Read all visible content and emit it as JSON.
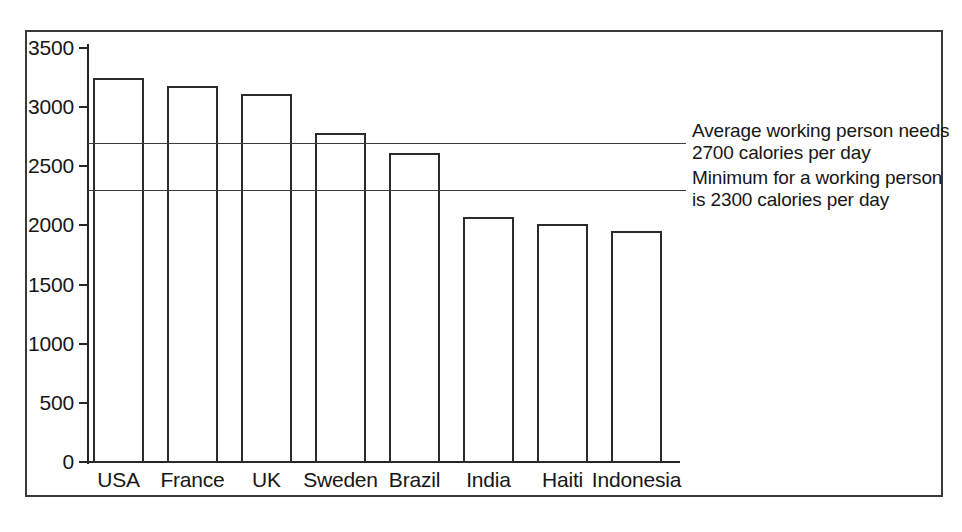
{
  "chart_data": {
    "type": "bar",
    "title": "",
    "subtitle": "",
    "xlabel": "",
    "ylabel": "",
    "categories": [
      "USA",
      "France",
      "UK",
      "Sweden",
      "Brazil",
      "India",
      "Haiti",
      "Indonesia"
    ],
    "values": [
      3250,
      3175,
      3110,
      2780,
      2610,
      2075,
      2015,
      1955
    ],
    "ylim": [
      0,
      3500
    ],
    "yticks": [
      0,
      500,
      1000,
      1500,
      2000,
      2500,
      3000,
      3500
    ],
    "ytick_labels": [
      "0",
      "500",
      "1000",
      "1500",
      "2000",
      "2500",
      "3000",
      "3500"
    ],
    "grid": false,
    "legend": "none",
    "bar_style": "outline",
    "reference_lines": [
      {
        "name": "average-working-person",
        "value": 2700,
        "label": "Average working person needs\n2700 calories per day"
      },
      {
        "name": "minimum-working-person",
        "value": 2300,
        "label": "Minimum for a working person\nis 2300  calories per day"
      }
    ],
    "colors": {
      "bar_outline": "#2b2b2b",
      "axis": "#242424",
      "reference_line": "#3c3c3c",
      "frame": "#3a3a3a",
      "background": "#ffffff",
      "text": "#161616"
    }
  }
}
